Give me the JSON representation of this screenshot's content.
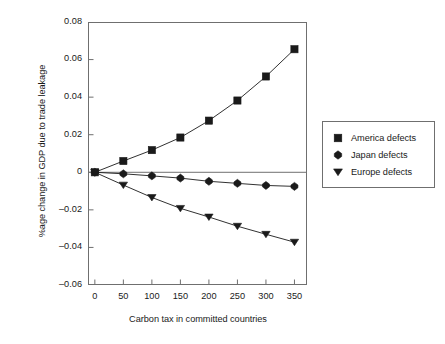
{
  "chart_data": {
    "type": "line",
    "title": "",
    "xlabel": "Carbon tax in committed countries",
    "ylabel": "%age change in GDP due to trade leakage",
    "x": [
      0,
      50,
      100,
      150,
      200,
      250,
      300,
      350
    ],
    "xlim": [
      -12,
      372
    ],
    "ylim": [
      -0.06,
      0.08
    ],
    "xticks": [
      "0",
      "50",
      "100",
      "150",
      "200",
      "250",
      "300",
      "350"
    ],
    "yticks": [
      "0.08",
      "0.06",
      "0.04",
      "0.02",
      "0",
      "-0.02",
      "-0.04",
      "-0.06"
    ],
    "ytick_values": [
      0.08,
      0.06,
      0.04,
      0.02,
      0,
      -0.02,
      -0.04,
      -0.06
    ],
    "grid": false,
    "legend_position": "right-outside",
    "series": [
      {
        "name": "America defects",
        "marker": "square",
        "color": "#1a1a1a",
        "values": [
          0,
          0.006,
          0.0118,
          0.0185,
          0.0275,
          0.0382,
          0.051,
          0.0655
        ]
      },
      {
        "name": "Japan defects",
        "marker": "diamond",
        "color": "#1a1a1a",
        "values": [
          0,
          -0.0008,
          -0.0019,
          -0.0031,
          -0.0048,
          -0.0059,
          -0.007,
          -0.0075
        ]
      },
      {
        "name": "Europe defects",
        "marker": "triangle-down",
        "color": "#1a1a1a",
        "values": [
          0,
          -0.0068,
          -0.0134,
          -0.0192,
          -0.0238,
          -0.0287,
          -0.033,
          -0.0372
        ]
      }
    ]
  },
  "legend": {
    "items": [
      {
        "label": "America defects"
      },
      {
        "label": "Japan defects"
      },
      {
        "label": "Europe defects"
      }
    ]
  },
  "colors": {
    "axis": "#6f6f6f",
    "ink": "#1a1a1a",
    "background": "#ffffff"
  }
}
